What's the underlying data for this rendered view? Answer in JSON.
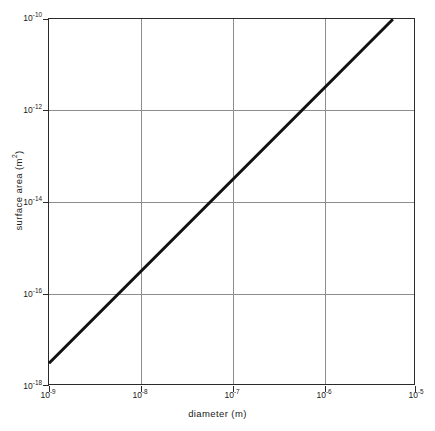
{
  "chart_data": {
    "type": "line",
    "title": "",
    "subtitle": "",
    "xlabel": "diameter (m)",
    "ylabel": "surface area (m²)",
    "xscale": "log",
    "yscale": "log",
    "xlim": [
      1e-09,
      1e-05
    ],
    "ylim": [
      1e-18,
      1e-10
    ],
    "grid": true,
    "legend": null,
    "legend_position": "none",
    "x_tick_labels": [
      "10⁻⁹",
      "10⁻⁸",
      "10⁻⁷",
      "10⁻⁶",
      "10⁻⁵"
    ],
    "x_tick_values": [
      1e-09,
      1e-08,
      1e-07,
      1e-06,
      1e-05
    ],
    "x_tick_mantissa": [
      "10",
      "10",
      "10",
      "10",
      "10"
    ],
    "x_tick_exponent": [
      "-9",
      "-8",
      "-7",
      "-6",
      "-5"
    ],
    "y_tick_labels": [
      "10⁻¹⁰",
      "10⁻¹²",
      "10⁻¹⁴",
      "10⁻¹⁶",
      "10⁻¹⁸"
    ],
    "y_tick_values": [
      1e-10,
      1e-12,
      1e-14,
      1e-16,
      1e-18
    ],
    "y_tick_mantissa": [
      "10",
      "10",
      "10",
      "10",
      "10"
    ],
    "y_tick_exponent": [
      "-10",
      "-12",
      "-14",
      "-16",
      "-18"
    ],
    "line_color": "#111111",
    "line_width": 3,
    "series": [
      {
        "name": "surface area of sphere",
        "relation": "A = π d²",
        "slope_loglog": 2,
        "x": [
          1e-09,
          1e-08,
          1e-07,
          1e-06,
          5.6e-06
        ],
        "y": [
          3.14e-18,
          3.14e-16,
          3.14e-14,
          3.14e-12,
          9.85e-11
        ]
      }
    ],
    "annotations": []
  },
  "axes": {
    "x_title": "diameter (m)",
    "y_title_prefix": "surface area (m",
    "y_title_exponent": "2",
    "y_title_suffix": ")"
  },
  "colors": {
    "background": "#ffffff",
    "frame": "#2b2b2b",
    "grid": "#8d8d8d",
    "data_line": "#111111",
    "text": "#1a1a1a"
  }
}
